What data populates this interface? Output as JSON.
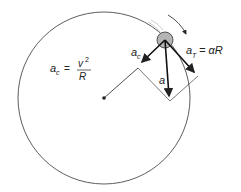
{
  "diagram": {
    "labels": {
      "ac_formula_lhs": "a",
      "ac_formula_sub": "c",
      "ac_formula_eq": "=",
      "ac_formula_num": "v",
      "ac_formula_num_exp": "2",
      "ac_formula_den": "R",
      "ac_vec": "a",
      "ac_vec_sub": "c",
      "a_vec": "a",
      "at_lhs": "a",
      "at_sub": "T",
      "at_rhs": "= αR"
    },
    "colors": {
      "line": "#222222",
      "ball_fill": "#b5b5b5"
    }
  }
}
